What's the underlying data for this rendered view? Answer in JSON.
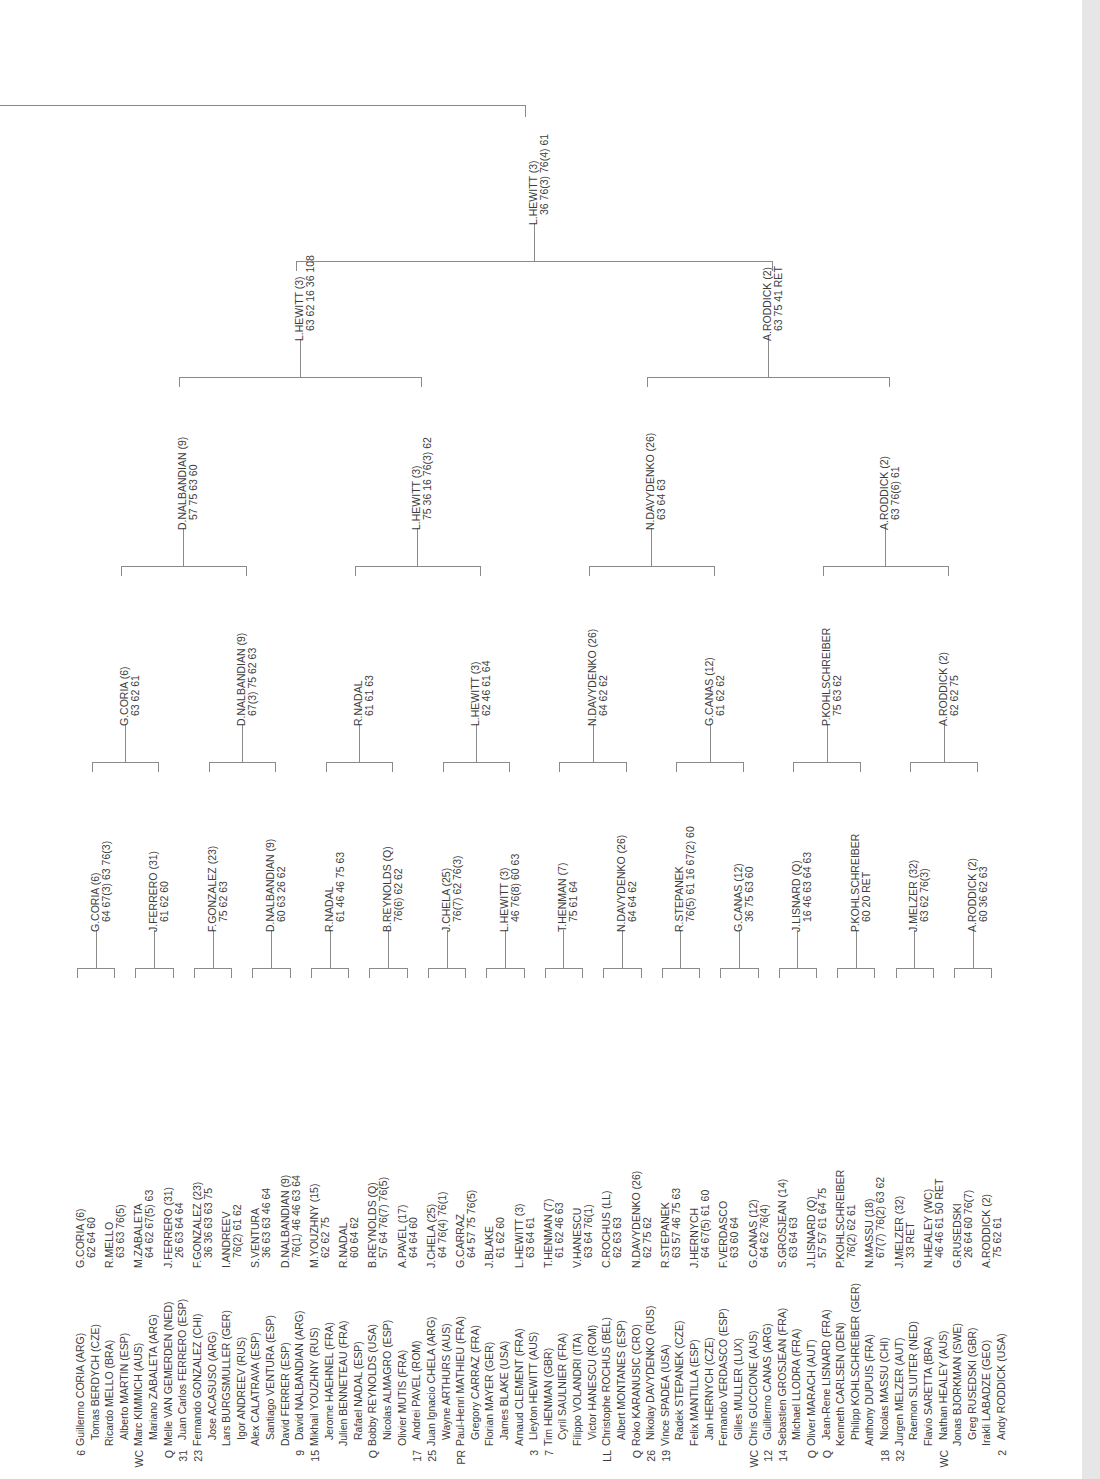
{
  "document": {
    "type": "tennis-draw-sheet",
    "orientation": "rotated-90"
  },
  "round1": {
    "players": [
      {
        "seed": "6",
        "name": "Guillermo CORIA (ARG)"
      },
      {
        "seed": "",
        "name": "Tomas BERDYCH (CZE)"
      },
      {
        "seed": "",
        "name": "Ricardo MELLO (BRA)"
      },
      {
        "seed": "",
        "name": "Alberto MARTIN (ESP)"
      },
      {
        "seed": "WC",
        "name": "Marc KIMMICH (AUS)"
      },
      {
        "seed": "",
        "name": "Mariano ZABALETA (ARG)"
      },
      {
        "seed": "Q",
        "name": "Melle VAN GEMERDEN (NED)"
      },
      {
        "seed": "31",
        "name": "Juan Carlos FERRERO (ESP)"
      },
      {
        "seed": "23",
        "name": "Fernando GONZALEZ (CHI)"
      },
      {
        "seed": "",
        "name": "Jose ACASUSO (ARG)"
      },
      {
        "seed": "",
        "name": "Lars BURGSMULLER (GER)"
      },
      {
        "seed": "",
        "name": "Igor ANDREEV (RUS)"
      },
      {
        "seed": "",
        "name": "Alex CALATRAVA (ESP)"
      },
      {
        "seed": "",
        "name": "Santiago VENTURA (ESP)"
      },
      {
        "seed": "",
        "name": "David FERRER (ESP)"
      },
      {
        "seed": "9",
        "name": "David NALBANDIAN (ARG)"
      },
      {
        "seed": "15",
        "name": "Mikhail YOUZHNY (RUS)"
      },
      {
        "seed": "",
        "name": "Jerome HAEHNEL (FRA)"
      },
      {
        "seed": "",
        "name": "Julien BENNETEAU (FRA)"
      },
      {
        "seed": "",
        "name": "Rafael NADAL (ESP)"
      },
      {
        "seed": "Q",
        "name": "Bobby REYNOLDS (USA)"
      },
      {
        "seed": "",
        "name": "Nicolas ALMAGRO (ESP)"
      },
      {
        "seed": "",
        "name": "Olivier MUTIS (FRA)"
      },
      {
        "seed": "17",
        "name": "Andrei PAVEL (ROM)"
      },
      {
        "seed": "25",
        "name": "Juan Ignacio CHELA (ARG)"
      },
      {
        "seed": "",
        "name": "Wayne ARTHURS (AUS)"
      },
      {
        "seed": "PR",
        "name": "Paul-Henri MATHIEU (FRA)"
      },
      {
        "seed": "",
        "name": "Gregory CARRAZ (FRA)"
      },
      {
        "seed": "",
        "name": "Florian MAYER (GER)"
      },
      {
        "seed": "",
        "name": "James BLAKE (USA)"
      },
      {
        "seed": "",
        "name": "Arnaud CLEMENT (FRA)"
      },
      {
        "seed": "3",
        "name": "Lleyton HEWITT (AUS)"
      },
      {
        "seed": "7",
        "name": "Tim HENMAN (GBR)"
      },
      {
        "seed": "",
        "name": "Cyril SAULNIER (FRA)"
      },
      {
        "seed": "",
        "name": "Filippo VOLANDRI (ITA)"
      },
      {
        "seed": "",
        "name": "Victor HANESCU (ROM)"
      },
      {
        "seed": "LL",
        "name": "Christophe ROCHUS (BEL)"
      },
      {
        "seed": "",
        "name": "Albert MONTANES (ESP)"
      },
      {
        "seed": "Q",
        "name": "Roko KARANUSIC (CRO)"
      },
      {
        "seed": "26",
        "name": "Nikolay DAVYDENKO (RUS)"
      },
      {
        "seed": "19",
        "name": "Vince SPADEA (USA)"
      },
      {
        "seed": "",
        "name": "Radek STEPANEK (CZE)"
      },
      {
        "seed": "",
        "name": "Felix MANTILLA (ESP)"
      },
      {
        "seed": "",
        "name": "Jan HERNYCH (CZE)"
      },
      {
        "seed": "",
        "name": "Fernando VERDASCO (ESP)"
      },
      {
        "seed": "",
        "name": "Gilles MULLER (LUX)"
      },
      {
        "seed": "WC",
        "name": "Chris GUCCIONE (AUS)"
      },
      {
        "seed": "12",
        "name": "Guillermo CANAS (ARG)"
      },
      {
        "seed": "14",
        "name": "Sebastien GROSJEAN (FRA)"
      },
      {
        "seed": "",
        "name": "Michael LLODRA (FRA)"
      },
      {
        "seed": "Q",
        "name": "Oliver MARACH (AUT)"
      },
      {
        "seed": "Q",
        "name": "Jean-Rene LISNARD (FRA)"
      },
      {
        "seed": "",
        "name": "Kenneth CARLSEN (DEN)"
      },
      {
        "seed": "",
        "name": "Philipp KOHLSCHREIBER (GER)"
      },
      {
        "seed": "",
        "name": "Anthony DUPUIS (FRA)"
      },
      {
        "seed": "18",
        "name": "Nicolas MASSU (CHI)"
      },
      {
        "seed": "32",
        "name": "Jurgen MELZER (AUT)"
      },
      {
        "seed": "",
        "name": "Raemon SLUITER (NED)"
      },
      {
        "seed": "",
        "name": "Flavio SARETTA (BRA)"
      },
      {
        "seed": "WC",
        "name": "Nathan HEALEY (AUS)"
      },
      {
        "seed": "",
        "name": "Jonas BJORKMAN (SWE)"
      },
      {
        "seed": "",
        "name": "Greg RUSEDSKI (GBR)"
      },
      {
        "seed": "",
        "name": "Irakli LABADZE (GEO)"
      },
      {
        "seed": "2",
        "name": "Andy RODDICK (USA)"
      }
    ]
  },
  "round2": {
    "results": [
      {
        "winner": "G.CORIA (6)",
        "score": "62 64 60"
      },
      {
        "winner": "R.MELLO",
        "score": "63 63 76(5)"
      },
      {
        "winner": "M.ZABALETA",
        "score": "64 62 67(5) 63"
      },
      {
        "winner": "J.FERRERO (31)",
        "score": "26 63 64 64"
      },
      {
        "winner": "F.GONZALEZ (23)",
        "score": "36 36 63 63 75"
      },
      {
        "winner": "I.ANDREEV",
        "score": "76(2) 61 62"
      },
      {
        "winner": "S.VENTURA",
        "score": "36 63 63 46 64"
      },
      {
        "winner": "D.NALBANDIAN (9)",
        "score": "76(1) 46 46 63 64"
      },
      {
        "winner": "M.YOUZHNY (15)",
        "score": "62 62 75"
      },
      {
        "winner": "R.NADAL",
        "score": "60 64 62"
      },
      {
        "winner": "B.REYNOLDS (Q)",
        "score": "57 64 76(7) 76(5)"
      },
      {
        "winner": "A.PAVEL (17)",
        "score": "64 64 60"
      },
      {
        "winner": "J.CHELA (25)",
        "score": "64 76(4) 76(1)"
      },
      {
        "winner": "G.CARRAZ",
        "score": "64 57 75 76(5)"
      },
      {
        "winner": "J.BLAKE",
        "score": "61 62 60"
      },
      {
        "winner": "L.HEWITT (3)",
        "score": "63 64 61"
      },
      {
        "winner": "T.HENMAN (7)",
        "score": "61 62 46 63"
      },
      {
        "winner": "V.HANESCU",
        "score": "63 64 76(1)"
      },
      {
        "winner": "C.ROCHUS (LL)",
        "score": "62 63 63"
      },
      {
        "winner": "N.DAVYDENKO (26)",
        "score": "62 75 62"
      },
      {
        "winner": "R.STEPANEK",
        "score": "63 57 46 75 63"
      },
      {
        "winner": "J.HERNYCH",
        "score": "64 67(5) 61 60"
      },
      {
        "winner": "F.VERDASCO",
        "score": "63 60 64"
      },
      {
        "winner": "G.CANAS (12)",
        "score": "64 62 76(4)"
      },
      {
        "winner": "S.GROSJEAN (14)",
        "score": "63 64 63"
      },
      {
        "winner": "J.LISNARD (Q)",
        "score": "57 57 61 64 75"
      },
      {
        "winner": "P.KOHLSCHREIBER",
        "score": "76(2) 62 61"
      },
      {
        "winner": "N.MASSU (18)",
        "score": "67(7) 76(2) 63 62"
      },
      {
        "winner": "J.MELZER (32)",
        "score": "33 RET"
      },
      {
        "winner": "N.HEALEY (WC)",
        "score": "46 46 61 50 RET"
      },
      {
        "winner": "G.RUSEDSKI",
        "score": "26 64 60 76(7)"
      },
      {
        "winner": "A.RODDICK (2)",
        "score": "75 62 61"
      }
    ]
  },
  "round3": {
    "results": [
      {
        "winner": "G.CORIA (6)",
        "score": "64 67(3) 63 76(3)"
      },
      {
        "winner": "J.FERRERO (31)",
        "score": "61 62 60"
      },
      {
        "winner": "F.GONZALEZ (23)",
        "score": "75 62 63"
      },
      {
        "winner": "D.NALBANDIAN (9)",
        "score": "60 63 26 62"
      },
      {
        "winner": "R.NADAL",
        "score": "61 46 46 75 63"
      },
      {
        "winner": "B.REYNOLDS (Q)",
        "score": "76(6) 62 62"
      },
      {
        "winner": "J.CHELA (25)",
        "score": "76(7) 62 76(3)"
      },
      {
        "winner": "L.HEWITT (3)",
        "score": "46 76(8) 60 63"
      },
      {
        "winner": "T.HENMAN (7)",
        "score": "75 61 64"
      },
      {
        "winner": "N.DAVYDENKO (26)",
        "score": "64 64 62"
      },
      {
        "winner": "R.STEPANEK",
        "score": "76(5) 61 16 67(2) 60"
      },
      {
        "winner": "G.CANAS (12)",
        "score": "36 75 63 60"
      },
      {
        "winner": "J.LISNARD (Q)",
        "score": "16 46 63 64 63"
      },
      {
        "winner": "P.KOHLSCHREIBER",
        "score": "60 20 RET"
      },
      {
        "winner": "J.MELZER (32)",
        "score": "63 62 76(3)"
      },
      {
        "winner": "A.RODDICK (2)",
        "score": "60 36 62 63"
      }
    ]
  },
  "round4": {
    "results": [
      {
        "winner": "G.CORIA (6)",
        "score": "63 62 61"
      },
      {
        "winner": "D.NALBANDIAN (9)",
        "score": "67(3) 75 62 63"
      },
      {
        "winner": "R.NADAL",
        "score": "61 61 63"
      },
      {
        "winner": "L.HEWITT (3)",
        "score": "62 46 61 64"
      },
      {
        "winner": "N.DAVYDENKO (26)",
        "score": "64 62 62"
      },
      {
        "winner": "G.CANAS (12)",
        "score": "61 62 62"
      },
      {
        "winner": "P.KOHLSCHREIBER",
        "score": "75 63 62"
      },
      {
        "winner": "A.RODDICK (2)",
        "score": "62 62 75"
      }
    ]
  },
  "quarterfinals": {
    "results": [
      {
        "winner": "D.NALBANDIAN (9)",
        "score": "57 75 63 60"
      },
      {
        "winner": "L.HEWITT (3)",
        "score": "75 36 16 76(3) 62"
      },
      {
        "winner": "N.DAVYDENKO (26)",
        "score": "63 64 63"
      },
      {
        "winner": "A.RODDICK (2)",
        "score": "63 76(6) 61"
      }
    ]
  },
  "semifinals": {
    "results": [
      {
        "winner": "L.HEWITT (3)",
        "score": "63 62 16 36 108"
      },
      {
        "winner": "A.RODDICK (2)",
        "score": "63 75 41 RET"
      }
    ]
  },
  "final": {
    "results": [
      {
        "winner": "L.HEWITT (3)",
        "score": "36 76(3) 76(4) 61"
      }
    ]
  }
}
